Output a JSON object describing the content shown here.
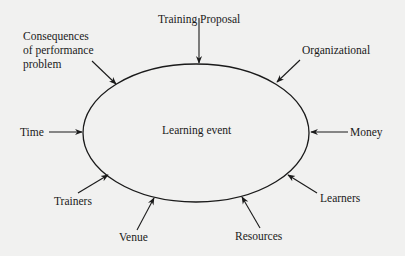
{
  "diagram": {
    "center": "Learning event",
    "influences": {
      "training_proposal": "Training Proposal",
      "organizational": "Organizational",
      "money": "Money",
      "learners": "Learners",
      "resources": "Resources",
      "venue": "Venue",
      "trainers": "Trainers",
      "time": "Time",
      "consequences_line1": "Consequences",
      "consequences_line2": "of performance",
      "consequences_line3": "problem"
    },
    "colors": {
      "background": "#f1f1f0",
      "stroke": "#1a1a1a",
      "text": "#1a1a1a"
    }
  }
}
